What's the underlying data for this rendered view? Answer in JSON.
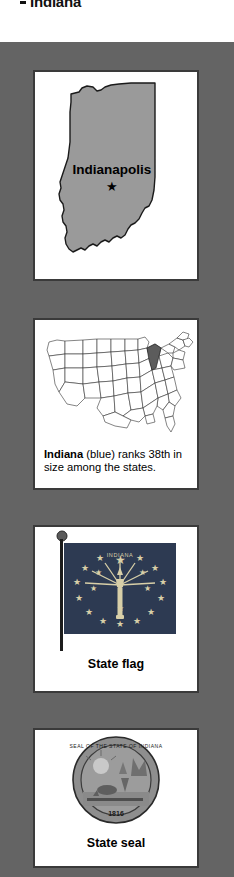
{
  "page": {
    "title": "Indiana",
    "background_color": "#646464",
    "card_background": "#ffffff",
    "card_border_color": "#3a3a3a"
  },
  "panels": {
    "state_map": {
      "name": "Indiana state map",
      "capital_label": "Indianapolis",
      "capital_marker": "star",
      "fill_color": "#9a9a9a",
      "outline_color": "#1a1a1a"
    },
    "us_map": {
      "name": "United States locator map",
      "caption_bold": "Indiana",
      "caption_rest": " (blue) ranks 38th in size among the states.",
      "caption_full": "Indiana (blue) ranks 38th in size among the states.",
      "rank": "38th",
      "highlight_color": "#5c5c5c",
      "outline_color": "#333333"
    },
    "flag": {
      "name": "Indiana state flag",
      "label": "State flag",
      "field_color": "#2d3a52",
      "emblem_color": "#d8cfa8",
      "arc_text": "INDIANA",
      "outer_stars": 13,
      "inner_stars": 5,
      "top_star": 1,
      "total_stars": 19,
      "pole_color": "#1c1c1c"
    },
    "seal": {
      "name": "Indiana state seal",
      "label": "State seal",
      "ring_text": "SEAL OF THE STATE OF INDIANA",
      "date": "1816",
      "body_color": "#8e8e8e",
      "ring_color": "#3c3c3c"
    }
  }
}
